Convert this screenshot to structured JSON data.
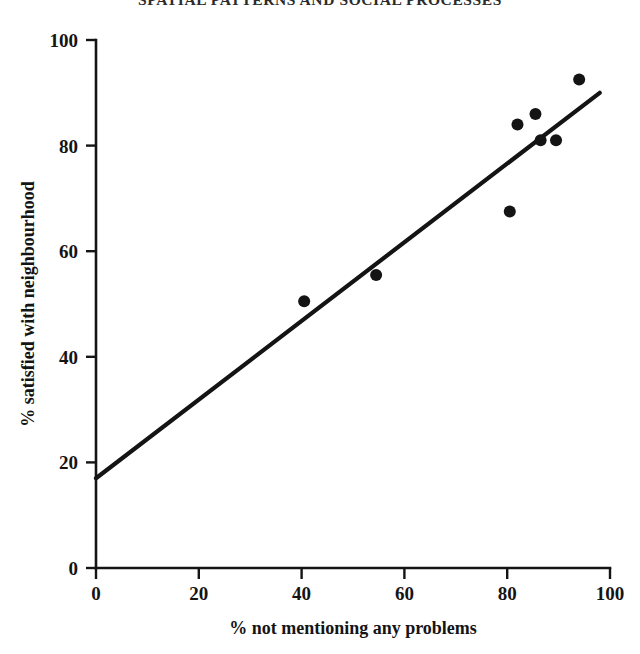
{
  "page": {
    "header_text": "SPATIAL PATTERNS AND SOCIAL PROCESSES"
  },
  "chart_data": {
    "type": "scatter",
    "title": "",
    "xlabel": "% not mentioning any problems",
    "ylabel": "% satisfied with neighbourhood",
    "xlim": [
      0,
      100
    ],
    "ylim": [
      0,
      100
    ],
    "xticks": [
      0,
      20,
      40,
      60,
      80,
      100
    ],
    "yticks": [
      0,
      20,
      40,
      60,
      80,
      100
    ],
    "xtick_labels": [
      "0",
      "20",
      "40",
      "60",
      "80",
      "100"
    ],
    "ytick_labels": [
      "0",
      "20",
      "40",
      "60",
      "80",
      "100"
    ],
    "grid": false,
    "legend": null,
    "series": [
      {
        "name": "neighbourhoods",
        "marker": "filled-circle",
        "color": "#141414",
        "points": [
          {
            "x": 40.5,
            "y": 50.5
          },
          {
            "x": 54.5,
            "y": 55.5
          },
          {
            "x": 80.5,
            "y": 67.5
          },
          {
            "x": 82.0,
            "y": 84.0
          },
          {
            "x": 85.5,
            "y": 86.0
          },
          {
            "x": 86.5,
            "y": 81.0
          },
          {
            "x": 89.5,
            "y": 81.0
          },
          {
            "x": 94.0,
            "y": 92.5
          }
        ]
      }
    ],
    "trendline": {
      "name": "fitted regression line",
      "color": "#141414",
      "x_start": 0,
      "y_start": 17,
      "x_end": 98,
      "y_end": 90
    }
  },
  "axes_geometry": {
    "x_origin_px": 96,
    "y_origin_px": 568,
    "x_end_px": 610,
    "y_top_px": 40
  }
}
